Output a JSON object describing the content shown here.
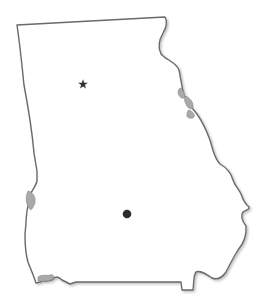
{
  "map": {
    "region": "Georgia (U.S. state) outline",
    "background_color": "#ffffff",
    "outline_color": "#6a6a6a",
    "water_color": "#a9a9a9",
    "markers": [
      {
        "type": "star",
        "icon": "star-icon",
        "x": 83,
        "y": 84,
        "color": "#333333"
      },
      {
        "type": "dot",
        "icon": "circle-dot-icon",
        "x": 127,
        "y": 214,
        "r": 4.3,
        "color": "#2b2b2b"
      }
    ]
  }
}
